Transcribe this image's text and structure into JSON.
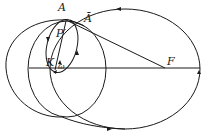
{
  "diagram": {
    "labels": {
      "A": "A",
      "A_bar": "Ā",
      "P_prime": "P′",
      "K": "K",
      "omega": "ω",
      "F": "F"
    },
    "elements": [
      "large orbit ellipse with focus F (arrows counter-clockwise)",
      "outer left circle",
      "inner circle through A",
      "small tilted ellipse from A to K",
      "line A-F",
      "line A-K",
      "horizontal axis through K and F"
    ],
    "colors": {
      "stroke": "#1a1a1a",
      "background": "#ffffff"
    }
  }
}
